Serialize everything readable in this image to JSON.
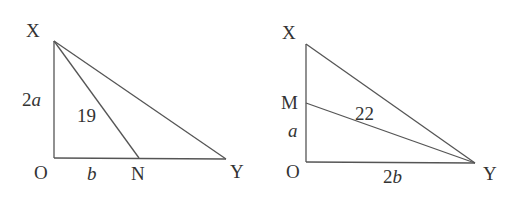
{
  "diagrams": [
    {
      "name": "left-triangle",
      "vertices": {
        "top": "X",
        "origin": "O",
        "mid": "N",
        "right": "Y"
      },
      "side_labels": {
        "vertical": "2a",
        "bottom": "b",
        "segment": "19"
      }
    },
    {
      "name": "right-triangle",
      "vertices": {
        "top": "X",
        "mid": "M",
        "origin": "O",
        "right": "Y"
      },
      "side_labels": {
        "lower_vertical": "a",
        "bottom": "2b",
        "segment": "22"
      }
    }
  ]
}
